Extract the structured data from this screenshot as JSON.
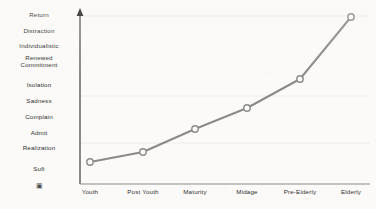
{
  "chart_data": {
    "type": "line",
    "title": "",
    "subtitle": "",
    "xlabel": "",
    "ylabel": "",
    "grid": true,
    "legend_position": "none",
    "categories": [
      "Youth",
      "Post Youth",
      "Maturity",
      "Midage",
      "Pre-Elderly",
      "Elderly"
    ],
    "y_categories": [
      "Return",
      "Distraction",
      "Individualistic",
      "Renewed\nCommitment",
      "Isolation",
      "Sadness",
      "Complain",
      "Admit",
      "Realization",
      "Sufi",
      "▣"
    ],
    "y_category_order": "top-to-bottom",
    "series": [
      {
        "name": "Stage progression",
        "values": [
          1,
          1.5,
          2.9,
          4.1,
          5.8,
          9.5
        ],
        "value_labels": [
          "Sufi",
          "between Sufi and Realization",
          "Admit",
          "Complain",
          "Isolation",
          "Return"
        ],
        "point_pixels": [
          {
            "x": 90,
            "y": 162
          },
          {
            "x": 143,
            "y": 152
          },
          {
            "x": 195,
            "y": 129
          },
          {
            "x": 247,
            "y": 108
          },
          {
            "x": 300,
            "y": 79
          },
          {
            "x": 351,
            "y": 17
          }
        ],
        "marker": "open-circle",
        "line_color": "#8a8a8a",
        "marker_fill": "#fcfbf9"
      }
    ],
    "ylim": [
      0,
      10
    ],
    "gridline_pixel_y": [
      16,
      96,
      143
    ],
    "colors": {
      "line": "#8a8a8a",
      "marker_stroke": "#8a8a8a",
      "marker_fill": "#fcfbf9",
      "y_axis": "#2b2b2b",
      "x_axis": "#8b8b8b",
      "gridline": "#ece8e2",
      "text": "#2f2f2f",
      "background": "#fbfaf8"
    },
    "axes": {
      "y_axis_arrow": "up-arrow",
      "y_axis_pixel_x": 80,
      "y_axis_pixel_top": 10,
      "y_axis_pixel_bottom": 184,
      "x_axis_pixel_y": 184,
      "x_axis_pixel_left": 80,
      "x_axis_pixel_right": 370
    }
  },
  "y_label_positions": [
    {
      "label_index": 0,
      "pixel_y": 15
    },
    {
      "label_index": 1,
      "pixel_y": 31
    },
    {
      "label_index": 2,
      "pixel_y": 46
    },
    {
      "label_index": 3,
      "pixel_y": 61
    },
    {
      "label_index": 4,
      "pixel_y": 85
    },
    {
      "label_index": 5,
      "pixel_y": 101
    },
    {
      "label_index": 6,
      "pixel_y": 117
    },
    {
      "label_index": 7,
      "pixel_y": 133
    },
    {
      "label_index": 8,
      "pixel_y": 148
    },
    {
      "label_index": 9,
      "pixel_y": 169
    },
    {
      "label_index": 10,
      "pixel_y": 186
    }
  ],
  "x_label_positions": [
    {
      "label_index": 0,
      "pixel_x": 90
    },
    {
      "label_index": 1,
      "pixel_x": 143
    },
    {
      "label_index": 2,
      "pixel_x": 195
    },
    {
      "label_index": 3,
      "pixel_x": 247
    },
    {
      "label_index": 4,
      "pixel_x": 300
    },
    {
      "label_index": 5,
      "pixel_x": 351
    }
  ],
  "icons": {
    "y_axis_arrow": "up-arrow-icon",
    "tofu_glyph": "missing-glyph-box-icon"
  }
}
